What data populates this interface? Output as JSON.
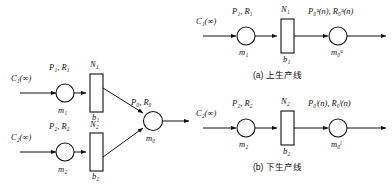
{
  "figure": {
    "kind": "production-line-queueing-diagram",
    "panels": [
      {
        "id": "combined",
        "caption": "",
        "source_upper": "C₁(∞)",
        "source_lower": "C₂(∞)",
        "machine_upper_rate": "P₁, R₁",
        "machine_upper_name": "m₁",
        "machine_lower_rate": "P₂, R₂",
        "machine_lower_name": "m₂",
        "buffer_upper_cap": "N₁",
        "buffer_upper_name": "b₁",
        "buffer_lower_cap": "N₂",
        "buffer_lower_name": "b₂",
        "merge_rate": "P₀, R₀",
        "merge_name": "m₀"
      },
      {
        "id": "upper-line",
        "caption": "(a) 上生产线",
        "source": "C₁(∞)",
        "machine_rate": "P₁, R₁",
        "machine_name": "m₁",
        "buffer_cap": "N₁",
        "buffer_name": "b₁",
        "sink_rate": "P₀ᵘ(n), R₀ᵘ(n)",
        "sink_name": "m₀ᵘ"
      },
      {
        "id": "lower-line",
        "caption": "(b) 下生产线",
        "source": "C₂(∞)",
        "machine_rate": "P₂, R₂",
        "machine_name": "m₂",
        "buffer_cap": "N₂",
        "buffer_name": "b₂",
        "sink_rate": "P₀ˡ(n), R₀ˡ(n)",
        "sink_name": "m₀ˡ"
      }
    ],
    "labels": {
      "C1": "C",
      "C2": "C",
      "infinity": "(∞)",
      "P": "P",
      "R": "R",
      "N": "N",
      "b": "b",
      "m": "m",
      "n_arg": "(n)",
      "sup_u": "u",
      "sup_l": "l",
      "sub_0": "0",
      "sub_1": "1",
      "sub_2": "2",
      "comma": ", "
    },
    "captions": {
      "a": "(a) 上生产线",
      "b": "(b) 下生产线"
    },
    "colors": {
      "stroke": "#111111",
      "background": "#ffffff",
      "fill": "#ffffff"
    }
  }
}
